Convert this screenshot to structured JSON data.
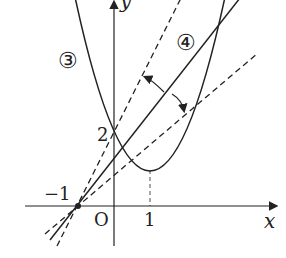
{
  "diagram": {
    "axes": {
      "x_label": "x",
      "y_label": "y",
      "origin_label": "O"
    },
    "tick_labels": {
      "x_one": "1",
      "y_two": "2",
      "neg_one": "−1"
    },
    "curve_labels": {
      "parabola": "③",
      "line": "④"
    },
    "curves": {
      "parabola": "y = (x-1)^2 + 1",
      "solid_line": "line through (-1,0)",
      "dashed_tangent_steep": "tangent through (-1,0) and (0,2)",
      "dashed_tangent_shallow": "tangent through (-1,0)"
    },
    "colors": {
      "stroke": "#222222"
    }
  }
}
